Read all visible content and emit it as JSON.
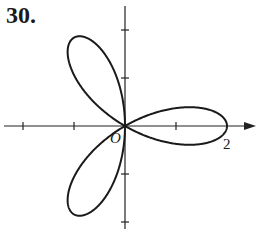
{
  "problem": {
    "number": "30."
  },
  "chart_data": {
    "type": "line",
    "title": "",
    "equation": "r = 2cos(3θ)",
    "petals": [
      {
        "angle_deg": 0,
        "length": 2
      },
      {
        "angle_deg": 120,
        "length": 2
      },
      {
        "angle_deg": 240,
        "length": 2
      }
    ],
    "axes": {
      "origin_label": "O",
      "x_tick_labels": [
        {
          "value": 2,
          "label": "2"
        }
      ],
      "x_ticks": [
        -2,
        -1,
        1,
        2
      ],
      "y_ticks": [
        -2,
        -1,
        1,
        2
      ],
      "xlim": [
        -2.3,
        2.6
      ],
      "ylim": [
        -2.3,
        2.4
      ],
      "x_arrow": true,
      "grid": false
    },
    "xlabel": "",
    "ylabel": ""
  }
}
